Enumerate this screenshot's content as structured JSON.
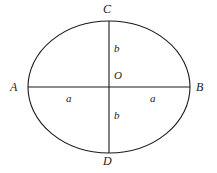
{
  "figure": {
    "type": "ellipse-with-axes-diagram",
    "background_color": "#ffffff",
    "stroke_color": "#1a1a1a",
    "stroke_width": 1,
    "geometry": {
      "center": {
        "x": 109,
        "y": 87,
        "label": "O"
      },
      "semi_major_axis_horizontal": 81,
      "semi_minor_axis_vertical": 66,
      "ellipse_bounds": {
        "left": 28,
        "top": 21,
        "right": 190,
        "bottom": 153
      }
    },
    "vertices": {
      "top": "C",
      "bottom": "D",
      "left": "A",
      "right": "B"
    },
    "segment_labels": {
      "center": "O",
      "semi_minor_upper": "b",
      "semi_minor_lower": "b",
      "semi_major_left": "a",
      "semi_major_right": "a"
    }
  }
}
